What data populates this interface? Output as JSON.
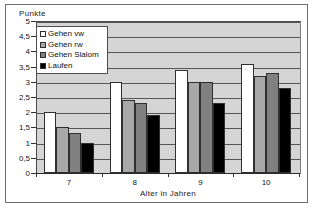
{
  "chart_data": {
    "type": "bar",
    "title": "",
    "ylabel": "Punkte",
    "xlabel": "Alter in Jahren",
    "categories": [
      "7",
      "8",
      "9",
      "10"
    ],
    "ylim": [
      0,
      5
    ],
    "ytick_step": 0.5,
    "ytick_labels": [
      "0",
      "0,5",
      "1",
      "1,5",
      "2",
      "2,5",
      "3",
      "3,5",
      "4",
      "4,5",
      "5"
    ],
    "ytick_values": [
      0,
      0.5,
      1,
      1.5,
      2,
      2.5,
      3,
      3.5,
      4,
      4.5,
      5
    ],
    "grid": true,
    "grid_axis": "y",
    "legend_position": "upper left",
    "series": [
      {
        "name": "Gehen vw",
        "color": "#ffffff",
        "values": [
          2.0,
          3.0,
          3.4,
          3.6
        ]
      },
      {
        "name": "Gehen rw",
        "color": "#a8a8a8",
        "values": [
          1.5,
          2.4,
          3.0,
          3.2
        ]
      },
      {
        "name": "Gehen Slalom",
        "color": "#808080",
        "values": [
          1.3,
          2.3,
          3.0,
          3.3
        ]
      },
      {
        "name": "Laufen",
        "color": "#000000",
        "values": [
          1.0,
          1.9,
          2.3,
          2.8
        ]
      }
    ]
  },
  "legend": {
    "items": [
      {
        "label": "Gehen vw"
      },
      {
        "label": "Gehen rw"
      },
      {
        "label": "Gehen Slalom"
      },
      {
        "label": "Laufen"
      }
    ]
  }
}
